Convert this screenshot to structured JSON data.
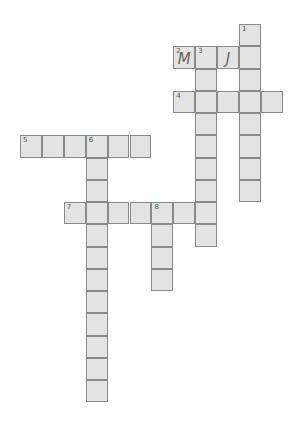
{
  "puzzle": {
    "type": "crossword",
    "cell_color": "#e3e3e3",
    "border_color": "#8a8a8a",
    "origin": {
      "x": 20,
      "y": 24
    },
    "cell_w": 21.9,
    "cell_h": 22.25,
    "entries": [
      {
        "number": "1",
        "direction": "down",
        "col": 10,
        "row": 0,
        "length": 8,
        "letters": ""
      },
      {
        "number": "2",
        "direction": "across",
        "col": 7,
        "row": 1,
        "length": 4,
        "letters": "M?J?"
      },
      {
        "number": "3",
        "direction": "down",
        "col": 8,
        "row": 1,
        "length": 9,
        "letters": ""
      },
      {
        "number": "4",
        "direction": "across",
        "col": 7,
        "row": 3,
        "length": 5,
        "letters": ""
      },
      {
        "number": "5",
        "direction": "across",
        "col": 0,
        "row": 5,
        "length": 6,
        "letters": ""
      },
      {
        "number": "6",
        "direction": "down",
        "col": 3,
        "row": 5,
        "length": 12,
        "letters": ""
      },
      {
        "number": "7",
        "direction": "across",
        "col": 2,
        "row": 8,
        "length": 7,
        "letters": ""
      },
      {
        "number": "8",
        "direction": "down",
        "col": 6,
        "row": 8,
        "length": 4,
        "letters": ""
      }
    ],
    "filled": [
      {
        "col": 7,
        "row": 1,
        "letter": "M"
      },
      {
        "col": 9,
        "row": 1,
        "letter": "J"
      }
    ]
  }
}
